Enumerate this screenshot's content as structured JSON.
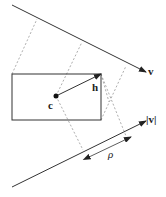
{
  "diagram": {
    "labels": {
      "v": "v",
      "h": "h",
      "c": "c",
      "abs_v": "|v|",
      "rho": "ρ"
    },
    "colors": {
      "line": "#333333",
      "dashed": "#999999"
    }
  }
}
